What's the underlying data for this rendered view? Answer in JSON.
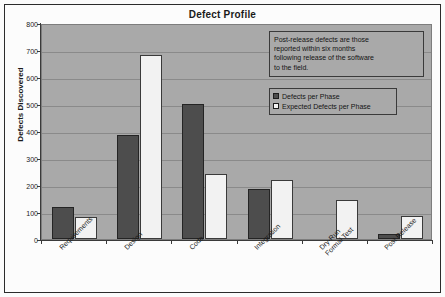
{
  "chart_data": {
    "type": "bar",
    "title": "Defect Profile",
    "xlabel": "",
    "ylabel": "Defects Discovered",
    "ylim": [
      0,
      800
    ],
    "ytick_step": 100,
    "yticks": [
      0,
      100,
      200,
      300,
      400,
      500,
      600,
      700,
      800
    ],
    "grid": true,
    "legend_position": "top-right",
    "categories": [
      "Requirements",
      "Design",
      "Code",
      "Integration",
      "Dry-Run\nFormal Test",
      "Post Release"
    ],
    "series": [
      {
        "name": "Defects per Phase",
        "color": "#4d4d4d",
        "values": [
          120,
          385,
          500,
          185,
          0,
          20
        ]
      },
      {
        "name": "Expected Defects per Phase",
        "color": "#f2f2f2",
        "values": [
          80,
          680,
          240,
          220,
          145,
          85
        ]
      }
    ],
    "annotations": [
      "Post-release defects are those reported within six months following release of the software to the field."
    ]
  },
  "annotation": {
    "line1": "Post-release defects are those",
    "line2": "reported within six months",
    "line3": "following release of the software",
    "line4": "to the field."
  },
  "colors": {
    "plot_background": "#a9a9a9",
    "series_1": "#4d4d4d",
    "series_2": "#f2f2f2",
    "axis": "#3a3a3a",
    "gridline": "#8a8a8a"
  }
}
